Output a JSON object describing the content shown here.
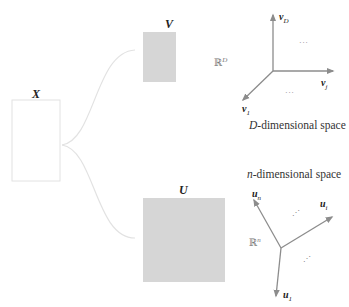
{
  "diagram": {
    "matrices": {
      "X": {
        "label": "X",
        "fill": "#ffffff",
        "border": "#e2e2e2"
      },
      "V": {
        "label": "V",
        "fill": "#d6d6d6"
      },
      "U": {
        "label": "U",
        "fill": "#d6d6d6"
      }
    },
    "connector_color": "#e2e2e2",
    "axis_color": "#8c8c8c",
    "d_space": {
      "caption_var": "D",
      "caption_rest": "-dimensional space",
      "space_symbol": "ℝ",
      "space_exp": "D",
      "vectors": [
        {
          "name": "v",
          "sub": "D"
        },
        {
          "name": "v",
          "sub": "j"
        },
        {
          "name": "v",
          "sub": "1"
        }
      ],
      "ellipsis_1": "···",
      "ellipsis_2": "···"
    },
    "n_space": {
      "caption_var": "n",
      "caption_rest": "-dimensional space",
      "space_symbol": "ℝ",
      "space_exp": "n",
      "vectors": [
        {
          "name": "u",
          "sub": "n"
        },
        {
          "name": "u",
          "sub": "i"
        },
        {
          "name": "u",
          "sub": "1"
        }
      ],
      "ellipsis_1": "⋰",
      "ellipsis_2": "⋰"
    }
  }
}
